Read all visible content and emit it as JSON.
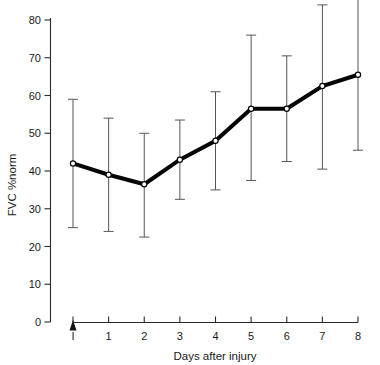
{
  "chart_data": {
    "type": "line",
    "title": "",
    "xlabel": "Days after injury",
    "ylabel": "FVC %norm",
    "categories": [
      "I",
      "1",
      "2",
      "3",
      "4",
      "5",
      "6",
      "7",
      "8"
    ],
    "x": [
      0,
      1,
      2,
      3,
      4,
      5,
      6,
      7,
      8
    ],
    "values": [
      42,
      39,
      36.5,
      43,
      48,
      56.5,
      56.5,
      62.5,
      65.5
    ],
    "error_upper": [
      59,
      54,
      50,
      53.5,
      61,
      76,
      70.5,
      84,
      86
    ],
    "error_lower": [
      25,
      24,
      22.5,
      32.5,
      35,
      37.5,
      42.5,
      40.5,
      45.5
    ],
    "series": [
      {
        "name": "FVC %norm",
        "values": [
          42,
          39,
          36.5,
          43,
          48,
          56.5,
          56.5,
          62.5,
          65.5
        ]
      }
    ],
    "xlim": [
      -0.35,
      8.2
    ],
    "ylim": [
      0,
      80
    ],
    "yticks": [
      0,
      10,
      20,
      30,
      40,
      50,
      60,
      70,
      80
    ],
    "ytick_labels": [
      "0",
      "10",
      "20",
      "30",
      "40",
      "50",
      "60",
      "70",
      "80"
    ],
    "xticks": [
      0,
      1,
      2,
      3,
      4,
      5,
      6,
      7,
      8
    ],
    "xtick_labels": [
      "I",
      "1",
      "2",
      "3",
      "4",
      "5",
      "6",
      "7",
      "8"
    ],
    "grid": false,
    "legend": null,
    "annotations": [
      {
        "name": "injury-arrow",
        "x": 0,
        "text": "I"
      }
    ],
    "colors": {
      "line": "#050505",
      "marker_fill": "#ffffff",
      "errorbar": "#555555",
      "axis": "#2b2b2b",
      "background": "#ffffff"
    }
  },
  "axes": {
    "y_title": "FVC %norm",
    "x_title": "Days after injury"
  }
}
